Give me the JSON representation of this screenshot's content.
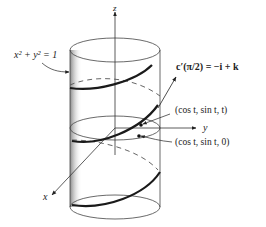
{
  "figure": {
    "type": "helix-on-cylinder",
    "labels": {
      "cylinder_equation": "x² + y² = 1",
      "z_axis": "z",
      "y_axis": "y",
      "x_axis": "x",
      "tangent_vector": "c′(π/2) = −i + k",
      "helix_point": "(cos t, sin t, t)",
      "projection_point": "(cos t, sin t, 0)"
    },
    "colors": {
      "line": "#333333",
      "helix": "#1a1a1a",
      "shade": "#9a9a9a",
      "text": "#222222"
    }
  }
}
